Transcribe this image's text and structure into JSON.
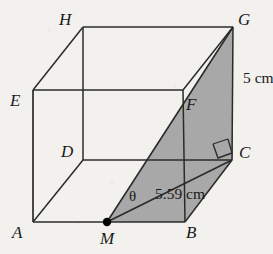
{
  "figure": {
    "kind": "cuboid-solid-geometry-diagram",
    "colors": {
      "background": "#f2f1ee",
      "stroke": "#2b2b2b",
      "shaded_plane_fill": "#a8a8a8",
      "label_text": "#1a1a1a",
      "point_marker": "#000000"
    },
    "vertices": [
      {
        "name": "A",
        "label": "A",
        "x": 33,
        "y": 222,
        "label_x": 12,
        "label_y": 226
      },
      {
        "name": "B",
        "label": "B",
        "x": 185,
        "y": 222,
        "label_x": 186,
        "label_y": 226
      },
      {
        "name": "C",
        "label": "C",
        "x": 232,
        "y": 160,
        "label_x": 238,
        "label_y": 144
      },
      {
        "name": "D",
        "label": "D",
        "x": 83,
        "y": 160,
        "label_x": 62,
        "label_y": 144
      },
      {
        "name": "E",
        "label": "E",
        "x": 33,
        "y": 90,
        "label_x": 10,
        "label_y": 92
      },
      {
        "name": "F",
        "label": "F",
        "x": 183,
        "y": 90,
        "label_x": 186,
        "label_y": 95
      },
      {
        "name": "G",
        "label": "G",
        "x": 233,
        "y": 27,
        "label_x": 237,
        "label_y": 11
      },
      {
        "name": "H",
        "label": "H",
        "x": 83,
        "y": 27,
        "label_x": 60,
        "label_y": 10
      },
      {
        "name": "M",
        "label": "M",
        "x": 107,
        "y": 222,
        "label_x": 100,
        "label_y": 230
      }
    ],
    "midpoint": {
      "name": "M",
      "on_edge": "AB",
      "marker": "filled-dot",
      "radius": 4
    },
    "shaded_plane": {
      "name": "plane-MGC",
      "path_points": "M,F,G,C",
      "description": "shaded cross-section M-G-C"
    },
    "angle": {
      "symbol": "θ",
      "at_vertex": "M",
      "between": "MC and MG",
      "label_x": 129,
      "label_y": 188
    },
    "right_angle": {
      "at_vertex": "C",
      "between": "MC and CG",
      "marker": "square"
    },
    "dimensions": [
      {
        "name": "edge-CG-length",
        "text": "5 cm",
        "edge": "CG",
        "label_x": 243,
        "label_y": 70
      },
      {
        "name": "segment-MC-length",
        "text": "5.59 cm",
        "edge": "MC",
        "label_x": 155,
        "label_y": 186
      }
    ]
  }
}
